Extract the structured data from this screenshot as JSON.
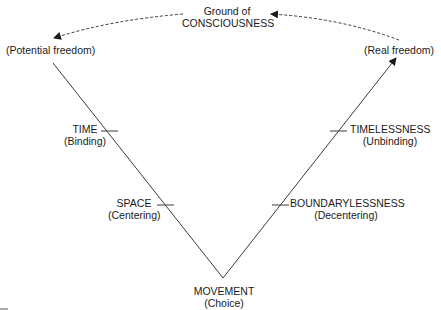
{
  "top": {
    "line1": "Ground of",
    "line2": "CONSCIOUSNESS"
  },
  "left_top": {
    "label": "(Potential freedom)"
  },
  "right_top": {
    "label": "(Real freedom)"
  },
  "left_marks": [
    {
      "title": "TIME",
      "subtitle": "(Binding)"
    },
    {
      "title": "SPACE",
      "subtitle": "(Centering)"
    }
  ],
  "right_marks": [
    {
      "title": "TIMELESSNESS",
      "subtitle": "(Unbinding)"
    },
    {
      "title": "BOUNDARYLESSNESS",
      "subtitle": "(Decentering)"
    }
  ],
  "bottom": {
    "title": "MOVEMENT",
    "subtitle": "(Choice)"
  },
  "colors": {
    "line": "#3a3a3a",
    "text": "#1a1a1a"
  }
}
